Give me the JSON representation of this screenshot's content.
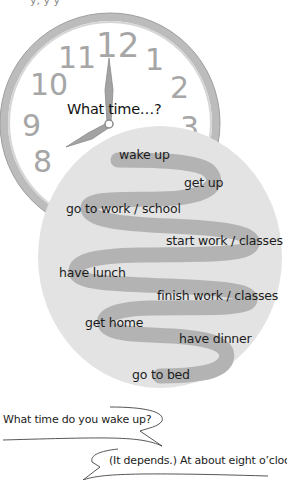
{
  "header": {
    "cut_off_text": "y, y   y"
  },
  "clock": {
    "numbers": [
      "12",
      "1",
      "2",
      "3",
      "8",
      "9",
      "10",
      "11"
    ],
    "time_shown": "8:00",
    "title": "What time…?"
  },
  "routine": {
    "items": [
      {
        "label": "wake up"
      },
      {
        "label": "get up"
      },
      {
        "label": "go to work / school"
      },
      {
        "label": "start work / classes"
      },
      {
        "label": "have lunch"
      },
      {
        "label": "finish work / classes"
      },
      {
        "label": "get home"
      },
      {
        "label": "have dinner"
      },
      {
        "label": "go to bed"
      }
    ]
  },
  "dialogue": {
    "question": "What time do you wake up?",
    "answer": "(It depends.) At about eight o’clock."
  },
  "colors": {
    "clock_rim": "#b9b9b9",
    "clock_face": "#ffffff",
    "circle_fill": "#e3e3e3",
    "path_fill": "#b3b3b3",
    "numbers": "#a6a6a6"
  }
}
